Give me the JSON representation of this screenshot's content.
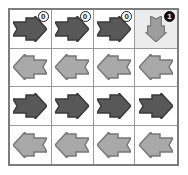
{
  "grid": {
    "rows": 4,
    "cols": 4,
    "colors": {
      "arrow_dark": "#585858",
      "arrow_light": "#a9a9a9",
      "arrow_medium": "#9d9d9d",
      "arrow_outline_dark": "#3a3a3a",
      "arrow_outline_light": "#777777",
      "cell_background": "#ffffff",
      "cell_highlight_background": "#ececec",
      "grid_line": "#9a9a9a",
      "frame_border": "#7d7d7d",
      "badge_light_fill": "#ffffff",
      "badge_dark_fill": "#0d0d0d"
    },
    "cells": [
      {
        "id": "cell-r1c1",
        "direction": "right",
        "shade": "dark",
        "highlight": false,
        "badge": "0",
        "badge_style": "light"
      },
      {
        "id": "cell-r1c2",
        "direction": "right",
        "shade": "dark",
        "highlight": false,
        "badge": "0",
        "badge_style": "light"
      },
      {
        "id": "cell-r1c3",
        "direction": "right",
        "shade": "dark",
        "highlight": false,
        "badge": "0",
        "badge_style": "light"
      },
      {
        "id": "cell-r1c4",
        "direction": "down",
        "shade": "medium",
        "highlight": true,
        "badge": "1",
        "badge_style": "dark"
      },
      {
        "id": "cell-r2c1",
        "direction": "left",
        "shade": "light",
        "highlight": false,
        "badge": null,
        "badge_style": null
      },
      {
        "id": "cell-r2c2",
        "direction": "left",
        "shade": "light",
        "highlight": false,
        "badge": null,
        "badge_style": null
      },
      {
        "id": "cell-r2c3",
        "direction": "left",
        "shade": "light",
        "highlight": false,
        "badge": null,
        "badge_style": null
      },
      {
        "id": "cell-r2c4",
        "direction": "left",
        "shade": "light",
        "highlight": false,
        "badge": null,
        "badge_style": null
      },
      {
        "id": "cell-r3c1",
        "direction": "right",
        "shade": "dark",
        "highlight": false,
        "badge": null,
        "badge_style": null
      },
      {
        "id": "cell-r3c2",
        "direction": "right",
        "shade": "dark",
        "highlight": false,
        "badge": null,
        "badge_style": null
      },
      {
        "id": "cell-r3c3",
        "direction": "right",
        "shade": "dark",
        "highlight": false,
        "badge": null,
        "badge_style": null
      },
      {
        "id": "cell-r3c4",
        "direction": "right",
        "shade": "dark",
        "highlight": false,
        "badge": null,
        "badge_style": null
      },
      {
        "id": "cell-r4c1",
        "direction": "left",
        "shade": "light",
        "highlight": false,
        "badge": null,
        "badge_style": null
      },
      {
        "id": "cell-r4c2",
        "direction": "left",
        "shade": "light",
        "highlight": false,
        "badge": null,
        "badge_style": null
      },
      {
        "id": "cell-r4c3",
        "direction": "left",
        "shade": "light",
        "highlight": false,
        "badge": null,
        "badge_style": null
      },
      {
        "id": "cell-r4c4",
        "direction": "left",
        "shade": "light",
        "highlight": false,
        "badge": null,
        "badge_style": null
      }
    ]
  }
}
